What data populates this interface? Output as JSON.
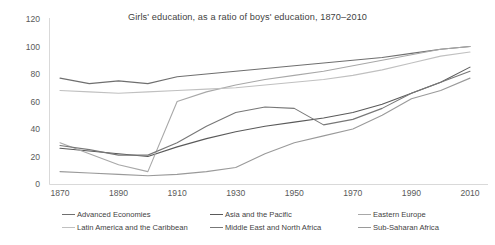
{
  "chart_data": {
    "type": "line",
    "title": "Girls' education, as a ratio of boys' education, 1870–2010",
    "xlabel": "",
    "ylabel": "",
    "xlim": [
      1870,
      2010
    ],
    "ylim": [
      0,
      120
    ],
    "grid": false,
    "legend_position": "bottom",
    "xticks": [
      1870,
      1890,
      1910,
      1930,
      1950,
      1970,
      1990,
      2010
    ],
    "yticks": [
      0,
      20,
      40,
      60,
      80,
      100,
      120
    ],
    "x": [
      1870,
      1880,
      1890,
      1900,
      1910,
      1920,
      1930,
      1940,
      1950,
      1960,
      1970,
      1980,
      1990,
      2000,
      2010
    ],
    "series": [
      {
        "name": "Advanced Economies",
        "color": "#6f6f6f",
        "values": [
          77,
          73,
          75,
          73,
          78,
          80,
          82,
          84,
          86,
          88,
          90,
          92,
          95,
          98,
          100
        ]
      },
      {
        "name": "Asia and the Pacific",
        "color": "#5a5a5a",
        "values": [
          26,
          24,
          22,
          20,
          27,
          33,
          38,
          42,
          45,
          48,
          52,
          58,
          66,
          74,
          85
        ]
      },
      {
        "name": "Eastern Europe",
        "color": "#a8a8a8",
        "values": [
          30,
          22,
          14,
          9,
          60,
          67,
          72,
          76,
          79,
          82,
          86,
          90,
          94,
          98,
          100
        ]
      },
      {
        "name": "Latin America and the Caribbean",
        "color": "#c0c0c0",
        "values": [
          68,
          67,
          66,
          67,
          68,
          69,
          70,
          72,
          74,
          76,
          79,
          83,
          88,
          93,
          96
        ]
      },
      {
        "name": "Middle East and North Africa",
        "color": "#777777",
        "values": [
          28,
          25,
          21,
          21,
          30,
          42,
          52,
          56,
          55,
          43,
          47,
          55,
          66,
          74,
          82
        ]
      },
      {
        "name": "Sub-Saharan Africa",
        "color": "#9a9a9a",
        "values": [
          9,
          8,
          7,
          6,
          7,
          9,
          12,
          22,
          30,
          35,
          40,
          50,
          62,
          68,
          77
        ]
      }
    ]
  },
  "legend": {
    "items": [
      "Advanced Economies",
      "Asia and the Pacific",
      "Eastern Europe",
      "Latin America and the Caribbean",
      "Middle East and North Africa",
      "Sub-Saharan Africa"
    ]
  },
  "axis": {
    "y_labels": [
      "120",
      "100",
      "80",
      "60",
      "40",
      "20",
      "0"
    ],
    "x_labels": [
      "1870",
      "1890",
      "1910",
      "1930",
      "1950",
      "1970",
      "1990",
      "2010"
    ]
  },
  "colors": {
    "axis_line": "#d9d9d9",
    "text": "#3f3f3f",
    "background": "#ffffff"
  }
}
